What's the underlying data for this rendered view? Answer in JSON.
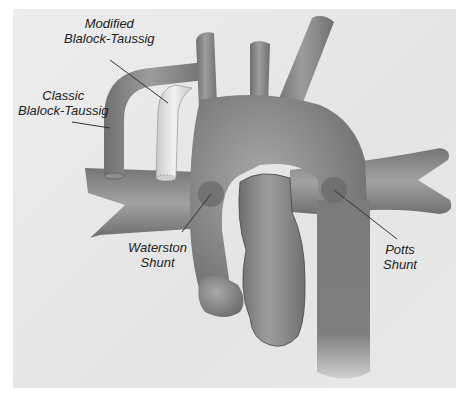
{
  "figure": {
    "type": "anatomical illustration",
    "background_color": "#e6e6e6",
    "vessel_color": "#8a8a8a",
    "graft_color": "#dcdcdc"
  },
  "labels": {
    "modified_bt": {
      "line1": "Modified",
      "line2": "Blalock-Taussig"
    },
    "classic_bt": {
      "line1": "Classic",
      "line2": "Blalock-Taussig"
    },
    "waterston": {
      "line1": "Waterston",
      "line2": "Shunt"
    },
    "potts": {
      "line1": "Potts",
      "line2": "Shunt"
    }
  }
}
